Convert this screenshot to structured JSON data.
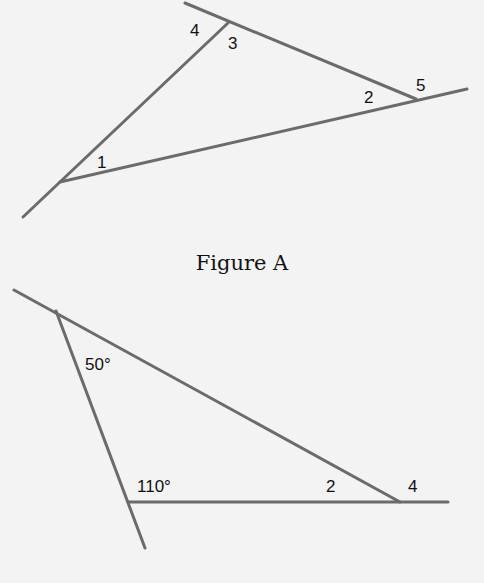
{
  "figure_a": {
    "caption": "Figure A",
    "vertices": {
      "v1": [
        60,
        182
      ],
      "v3": [
        228,
        23
      ],
      "v5": [
        416,
        99
      ]
    },
    "lines": [
      {
        "name": "side-1-3",
        "x1": 23,
        "y1": 217,
        "x2": 228,
        "y2": 23
      },
      {
        "name": "side-3-5",
        "x1": 185,
        "y1": 3,
        "x2": 416,
        "y2": 99
      },
      {
        "name": "side-1-5",
        "x1": 60,
        "y1": 182,
        "x2": 467,
        "y2": 89
      }
    ],
    "labels": [
      {
        "text": "1",
        "x": 97,
        "y": 168
      },
      {
        "text": "2",
        "x": 364,
        "y": 103
      },
      {
        "text": "3",
        "x": 228,
        "y": 49
      },
      {
        "text": "4",
        "x": 190,
        "y": 36
      },
      {
        "text": "5",
        "x": 416,
        "y": 91
      }
    ]
  },
  "figure_b": {
    "vertices": {
      "top": [
        56,
        311
      ],
      "bottom": [
        128,
        502
      ],
      "right": [
        400,
        502
      ]
    },
    "lines": [
      {
        "name": "side-top-right",
        "x1": 14,
        "y1": 290,
        "x2": 400,
        "y2": 502
      },
      {
        "name": "side-top-bottom",
        "x1": 56,
        "y1": 311,
        "x2": 145,
        "y2": 548
      },
      {
        "name": "side-bottom-right",
        "x1": 128,
        "y1": 502,
        "x2": 448,
        "y2": 502
      }
    ],
    "labels": [
      {
        "text": "50°",
        "x": 85,
        "y": 370
      },
      {
        "text": "110°",
        "x": 137,
        "y": 492
      },
      {
        "text": "2",
        "x": 326,
        "y": 492
      },
      {
        "text": "4",
        "x": 408,
        "y": 492
      }
    ]
  }
}
